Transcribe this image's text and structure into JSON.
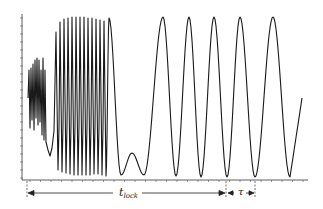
{
  "chart_data": {
    "type": "line",
    "title": "",
    "xlabel": "",
    "ylabel": "",
    "grid": false,
    "legend": null,
    "axes": {
      "y_axis_x_px": 22,
      "x_axis_y_px": 180,
      "tick_labels_visible": false
    },
    "annotations": {
      "lock_time": {
        "symbol": "t",
        "subscript": "lock",
        "start_px": 27,
        "end_px": 226
      },
      "period": {
        "symbol": "τ",
        "start_px": 226,
        "end_px": 255
      }
    },
    "steady_peaks_x_px": [
      109,
      163,
      189,
      214,
      240,
      273
    ],
    "steady_valleys_x_px": [
      121,
      144,
      176,
      201,
      227,
      255,
      290
    ],
    "line_color": "#1a1a1a"
  },
  "labels": {
    "tlock_main": "t",
    "tlock_sub": "lock",
    "tau": "τ"
  }
}
